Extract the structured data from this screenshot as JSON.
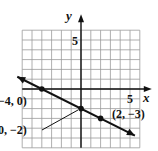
{
  "chart_data": {
    "type": "line",
    "title": "",
    "xlabel": "x",
    "ylabel": "y",
    "xlim": [
      -6,
      6
    ],
    "ylim": [
      -6,
      6
    ],
    "grid": true,
    "tick_labels": {
      "x": [
        "5"
      ],
      "y": [
        "5"
      ]
    },
    "series": [
      {
        "name": "line",
        "equation": "y = -1/2 x - 2",
        "x": [
          -6.5,
          -4,
          0,
          2,
          5.5
        ],
        "y": [
          1.25,
          0,
          -2,
          -3,
          -4.75
        ],
        "arrows_both_ends": true
      }
    ],
    "points": [
      {
        "x": -4,
        "y": 0,
        "label": "(−4, 0)"
      },
      {
        "x": 0,
        "y": -2,
        "label": "(0, −2)"
      },
      {
        "x": 2,
        "y": -3,
        "label": "(2, −3)"
      }
    ],
    "colors": {
      "ink": "#111111",
      "grid": "#9a9a9a"
    }
  },
  "labels": {
    "x_axis": "x",
    "y_axis": "y",
    "x_tick_5": "5",
    "y_tick_5": "5",
    "pt1": "−4, 0)",
    "pt2": "0, −2)",
    "pt3": "(2, −3)"
  }
}
